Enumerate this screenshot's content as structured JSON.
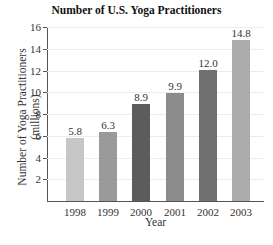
{
  "chart_data": {
    "type": "bar",
    "title": "Number of U.S. Yoga Practitioners",
    "xlabel": "Year",
    "ylabel": "Number of Yoga Practitioners (millions)",
    "ylabel_lines": [
      "Number of Yoga Practitioners",
      "(millions)"
    ],
    "categories": [
      "1998",
      "1999",
      "2000",
      "2001",
      "2002",
      "2003"
    ],
    "values": [
      5.8,
      6.3,
      8.9,
      9.9,
      12.0,
      14.8
    ],
    "value_labels": [
      "5.8",
      "6.3",
      "8.9",
      "9.9",
      "12.0",
      "14.8"
    ],
    "bar_colors": [
      "#c6c6c6",
      "#9a9a9a",
      "#5c5c5c",
      "#8c8c8c",
      "#707070",
      "#ababab"
    ],
    "ylim": [
      0,
      16
    ],
    "yticks": [
      2,
      4,
      6,
      8,
      10,
      12,
      14,
      16
    ],
    "grid": true,
    "legend": null
  }
}
